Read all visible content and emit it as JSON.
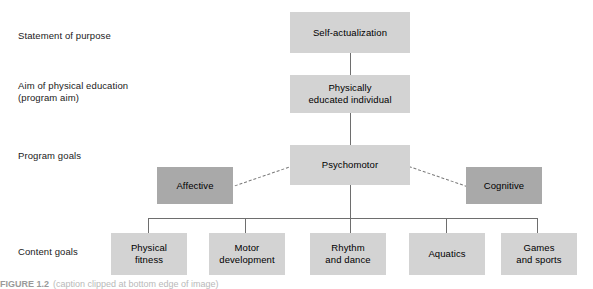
{
  "figure": {
    "row_labels": [
      {
        "id": "statement-of-purpose",
        "text": "Statement of purpose"
      },
      {
        "id": "aim-of-physical-education",
        "text": "Aim of physical education\n(program aim)"
      },
      {
        "id": "program-goals",
        "text": "Program goals"
      },
      {
        "id": "content-goals",
        "text": "Content goals"
      }
    ],
    "nodes": {
      "self_actualization": "Self-actualization",
      "physically_educated": "Physically\neducated individual",
      "psychomotor": "Psychomotor",
      "affective": "Affective",
      "cognitive": "Cognitive",
      "physical_fitness": "Physical\nfitness",
      "motor_development": "Motor\ndevelopment",
      "rhythm_and_dance": "Rhythm\nand dance",
      "aquatics": "Aquatics",
      "games_and_sports": "Games\nand sports"
    },
    "caption": {
      "tag": "FIGURE 1.2",
      "text": "(caption clipped at bottom edge of image)"
    },
    "colors": {
      "box_light": "#d3d3d3",
      "box_dark": "#a9a9a9",
      "connector": "#6e6e6e",
      "text": "#000000",
      "background": "#ffffff"
    }
  }
}
